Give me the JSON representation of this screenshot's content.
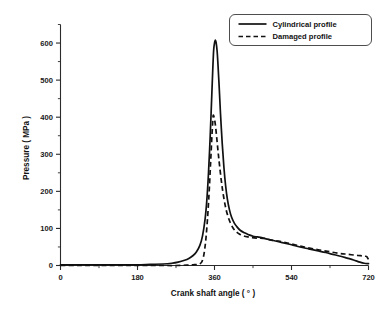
{
  "chart_data": {
    "type": "line",
    "title": "",
    "xlabel": "Crank shaft angle ( ° )",
    "ylabel": "Pressure ( MPa )",
    "xlim": [
      0,
      720
    ],
    "ylim": [
      0,
      650
    ],
    "grid": false,
    "legend_position": "top-right",
    "xticks": [
      0,
      180,
      360,
      540,
      720
    ],
    "xtick_labels": [
      "0",
      "180",
      "360",
      "540",
      "720"
    ],
    "x_minor_ticks": [
      90,
      270,
      450,
      630
    ],
    "yticks": [
      0,
      100,
      200,
      300,
      400,
      500,
      600
    ],
    "ytick_labels": [
      "0",
      "100",
      "200",
      "300",
      "400",
      "500",
      "600"
    ],
    "y_minor_ticks": [
      50,
      150,
      250,
      350,
      450,
      550,
      650
    ],
    "series": [
      {
        "name": "Cylindrical profile",
        "style": "solid",
        "color": "#111111",
        "peak_x": 362,
        "peak_y": 608,
        "x": [
          0,
          30,
          60,
          90,
          120,
          150,
          180,
          210,
          240,
          260,
          275,
          290,
          300,
          310,
          318,
          326,
          332,
          338,
          342,
          346,
          350,
          353,
          356,
          358,
          360,
          362,
          364,
          366,
          368,
          371,
          374,
          378,
          382,
          386,
          390,
          395,
          400,
          406,
          412,
          420,
          430,
          440,
          450,
          460,
          470,
          480,
          495,
          510,
          525,
          540,
          560,
          580,
          600,
          620,
          640,
          655,
          670,
          685,
          700,
          710,
          720
        ],
        "y": [
          2,
          2,
          2,
          2,
          2,
          2,
          2,
          3,
          4,
          6,
          9,
          14,
          19,
          27,
          37,
          55,
          80,
          125,
          175,
          250,
          350,
          440,
          530,
          580,
          600,
          608,
          600,
          580,
          545,
          480,
          410,
          330,
          265,
          215,
          180,
          150,
          130,
          115,
          105,
          95,
          88,
          83,
          79,
          77,
          75,
          72,
          68,
          64,
          60,
          56,
          50,
          45,
          40,
          35,
          29,
          25,
          20,
          15,
          9,
          6,
          5
        ]
      },
      {
        "name": "Damaged profile",
        "style": "dashed",
        "color": "#111111",
        "peak_x": 357,
        "peak_y": 405,
        "x": [
          0,
          40,
          80,
          120,
          160,
          200,
          240,
          270,
          295,
          310,
          320,
          326,
          330,
          333,
          336,
          339,
          342,
          345,
          348,
          351,
          354,
          356,
          357,
          359,
          361,
          363,
          366,
          369,
          372,
          376,
          380,
          385,
          390,
          396,
          403,
          410,
          418,
          428,
          438,
          448,
          458,
          468,
          478,
          488,
          496,
          503,
          510,
          518,
          528,
          540,
          555,
          570,
          590,
          610,
          630,
          650,
          665,
          680,
          695,
          705,
          712,
          716,
          720
        ],
        "y": [
          0,
          0,
          0,
          0,
          0,
          0,
          0,
          0,
          1,
          2,
          3,
          5,
          9,
          18,
          35,
          62,
          100,
          150,
          210,
          280,
          350,
          390,
          405,
          400,
          388,
          370,
          335,
          300,
          268,
          228,
          195,
          162,
          138,
          118,
          102,
          92,
          85,
          80,
          77,
          75,
          74,
          74,
          73,
          70,
          68,
          67,
          66,
          64,
          61,
          58,
          54,
          50,
          45,
          41,
          37,
          33,
          31,
          29,
          27,
          26,
          25,
          24,
          16
        ]
      }
    ]
  },
  "legend": {
    "items": [
      {
        "label": "Cylindrical profile",
        "style": "solid"
      },
      {
        "label": "Damaged profile",
        "style": "dashed"
      }
    ]
  }
}
